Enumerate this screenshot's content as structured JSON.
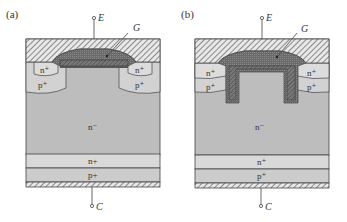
{
  "figure": {
    "panels": [
      {
        "id": "a",
        "label": "(a)",
        "type": "planar-gate IGBT",
        "terminals": {
          "emitter": "E",
          "gate": "G",
          "collector": "C"
        },
        "regions": {
          "left_n_plus": "n⁺",
          "left_p_plus": "p⁺",
          "right_n_plus": "n⁺",
          "right_p_plus": "p⁺",
          "drift": "n⁻",
          "buffer": "n+",
          "collector_layer": "p+"
        }
      },
      {
        "id": "b",
        "label": "(b)",
        "type": "trench-gate IGBT",
        "terminals": {
          "emitter": "E",
          "gate": "G",
          "collector": "C"
        },
        "regions": {
          "left_n_plus": "n⁺",
          "left_p_plus": "p⁺",
          "right_n_plus": "n⁺",
          "right_p_plus": "p⁺",
          "drift": "n⁻",
          "buffer": "n⁺",
          "collector_layer": "p⁺"
        }
      }
    ],
    "colors": {
      "metal_hatch": "#555555",
      "metal_bg": "#e6e6e6",
      "gate_poly": "#6e6e6e",
      "drift": "#bdbdbd",
      "n_plus_well": "#d8d8d8",
      "p_plus_well": "#cfcfcf",
      "buffer": "#d9d9d9",
      "collector_layer": "#cccccc",
      "outline": "#444444"
    }
  }
}
